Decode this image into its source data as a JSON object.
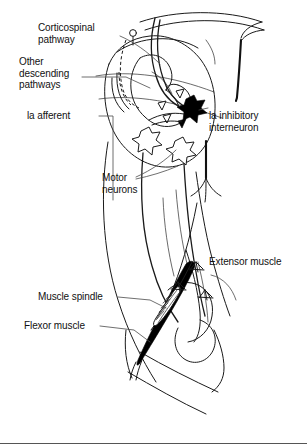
{
  "figure": {
    "background_color": "#ffffff",
    "ink_color": "#1a1a1a",
    "fill_black": "#000000",
    "fill_white": "#ffffff",
    "baseline_rule": true
  },
  "labels": {
    "corticospinal_pathway": "Corticospinal\npathway",
    "other_descending_pathways": "Other\ndescending\npathways",
    "ia_afferent": "la afferent",
    "ia_inhibitory_interneuron": "la inhibitory\ninterneuron",
    "motor_neurons": "Motor\nneurons",
    "extensor_muscle": "Extensor muscle",
    "muscle_spindle": "Muscle spindle",
    "flexor_muscle": "Flexor muscle"
  },
  "structures": {
    "spinal_cord": "spinal-cord-cross-section",
    "gray_matter": "butterfly-gray-matter",
    "central_canal_marker": "central-canal-circle",
    "interneuron_shape": "filled-black-star",
    "motor_neuron_shape": "open-white-star",
    "spindle_shape": "spindle-with-intrafusal-fibers",
    "leg": "hindlimb-outline-with-knee-joint",
    "flexor_fill": "#000000",
    "extensor_fill": "#ffffff"
  }
}
